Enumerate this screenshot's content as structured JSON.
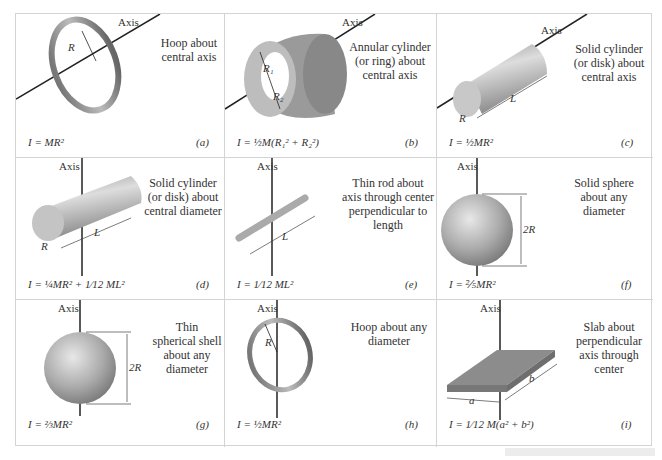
{
  "figure": {
    "axis_label": "Axis",
    "panels": [
      {
        "id": "a",
        "tag": "(a)",
        "description": [
          "Hoop about",
          "central axis"
        ],
        "formula": "I = MR²",
        "dims": [
          "R"
        ]
      },
      {
        "id": "b",
        "tag": "(b)",
        "description": [
          "Annular cylinder",
          "(or ring) about",
          "central axis"
        ],
        "formula": "I = ½M(R₁² + R₂²)",
        "dims": [
          "R₁",
          "R₂"
        ]
      },
      {
        "id": "c",
        "tag": "(c)",
        "description": [
          "Solid cylinder",
          "(or disk) about",
          "central axis"
        ],
        "formula": "I = ½MR²",
        "dims": [
          "R",
          "L"
        ]
      },
      {
        "id": "d",
        "tag": "(d)",
        "description": [
          "Solid cylinder",
          "(or disk) about",
          "central diameter"
        ],
        "formula": "I = ¼MR² + 1⁄12 ML²",
        "dims": [
          "R",
          "L"
        ]
      },
      {
        "id": "e",
        "tag": "(e)",
        "description": [
          "Thin rod about",
          "axis through center",
          "perpendicular to",
          "length"
        ],
        "formula": "I = 1⁄12 ML²",
        "dims": [
          "L"
        ]
      },
      {
        "id": "f",
        "tag": "(f)",
        "description": [
          "Solid sphere",
          "about any",
          "diameter"
        ],
        "formula": "I = ⅖MR²",
        "dims": [
          "2R"
        ]
      },
      {
        "id": "g",
        "tag": "(g)",
        "description": [
          "Thin",
          "spherical shell",
          "about any",
          "diameter"
        ],
        "formula": "I = ⅔MR²",
        "dims": [
          "2R"
        ]
      },
      {
        "id": "h",
        "tag": "(h)",
        "description": [
          "Hoop about any",
          "diameter"
        ],
        "formula": "I = ½MR²",
        "dims": [
          "R"
        ]
      },
      {
        "id": "i",
        "tag": "(i)",
        "description": [
          "Slab about",
          "perpendicular",
          "axis through",
          "center"
        ],
        "formula": "I = 1⁄12 M(a² + b²)",
        "dims": [
          "a",
          "b"
        ]
      }
    ]
  }
}
